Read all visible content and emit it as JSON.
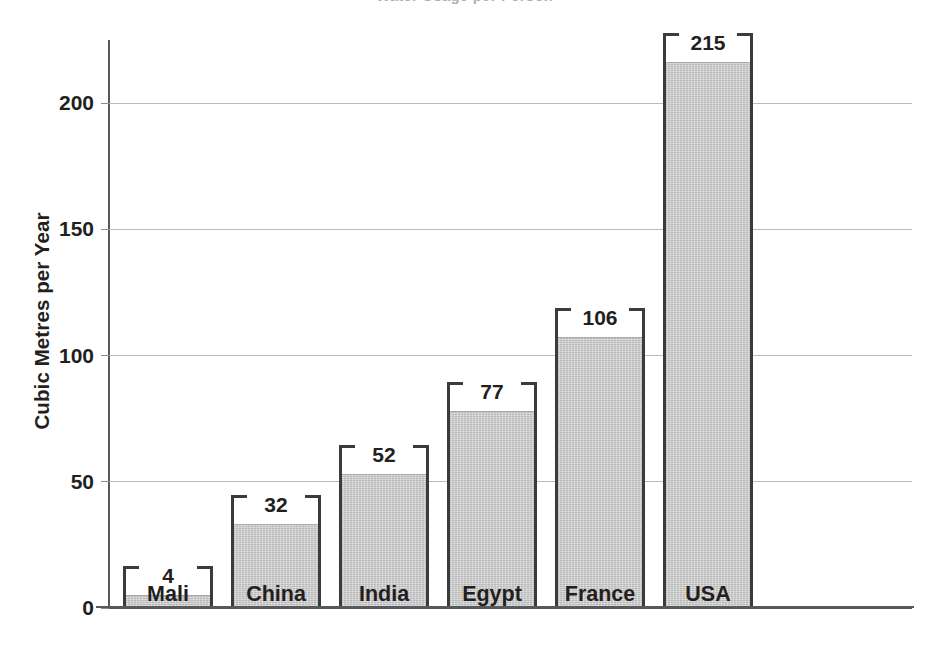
{
  "chart_data": {
    "type": "bar",
    "title": "Water Usage per Person",
    "xlabel": "",
    "ylabel": "Cubic Metres per Year",
    "categories": [
      "Mali",
      "China",
      "India",
      "Egypt",
      "France",
      "USA"
    ],
    "values": [
      4,
      32,
      52,
      77,
      106,
      215
    ],
    "value_labels": [
      "4",
      "32",
      "52",
      "77",
      "106",
      "215"
    ],
    "ylim": [
      0,
      225
    ],
    "yticks": [
      0,
      50,
      100,
      150,
      200
    ],
    "ytick_labels": [
      "0",
      "50",
      "100",
      "150",
      "200"
    ],
    "grid": true,
    "legend": null,
    "series": [
      {
        "name": "Cubic Metres per Year",
        "values": [
          4,
          32,
          52,
          77,
          106,
          215
        ]
      }
    ],
    "colors": {
      "bar_fill": "#c6c6c6",
      "bar_outline": "#3b3b3d",
      "gridline": "#b9babb",
      "axis": "#58595b",
      "text": "#231f20"
    }
  }
}
